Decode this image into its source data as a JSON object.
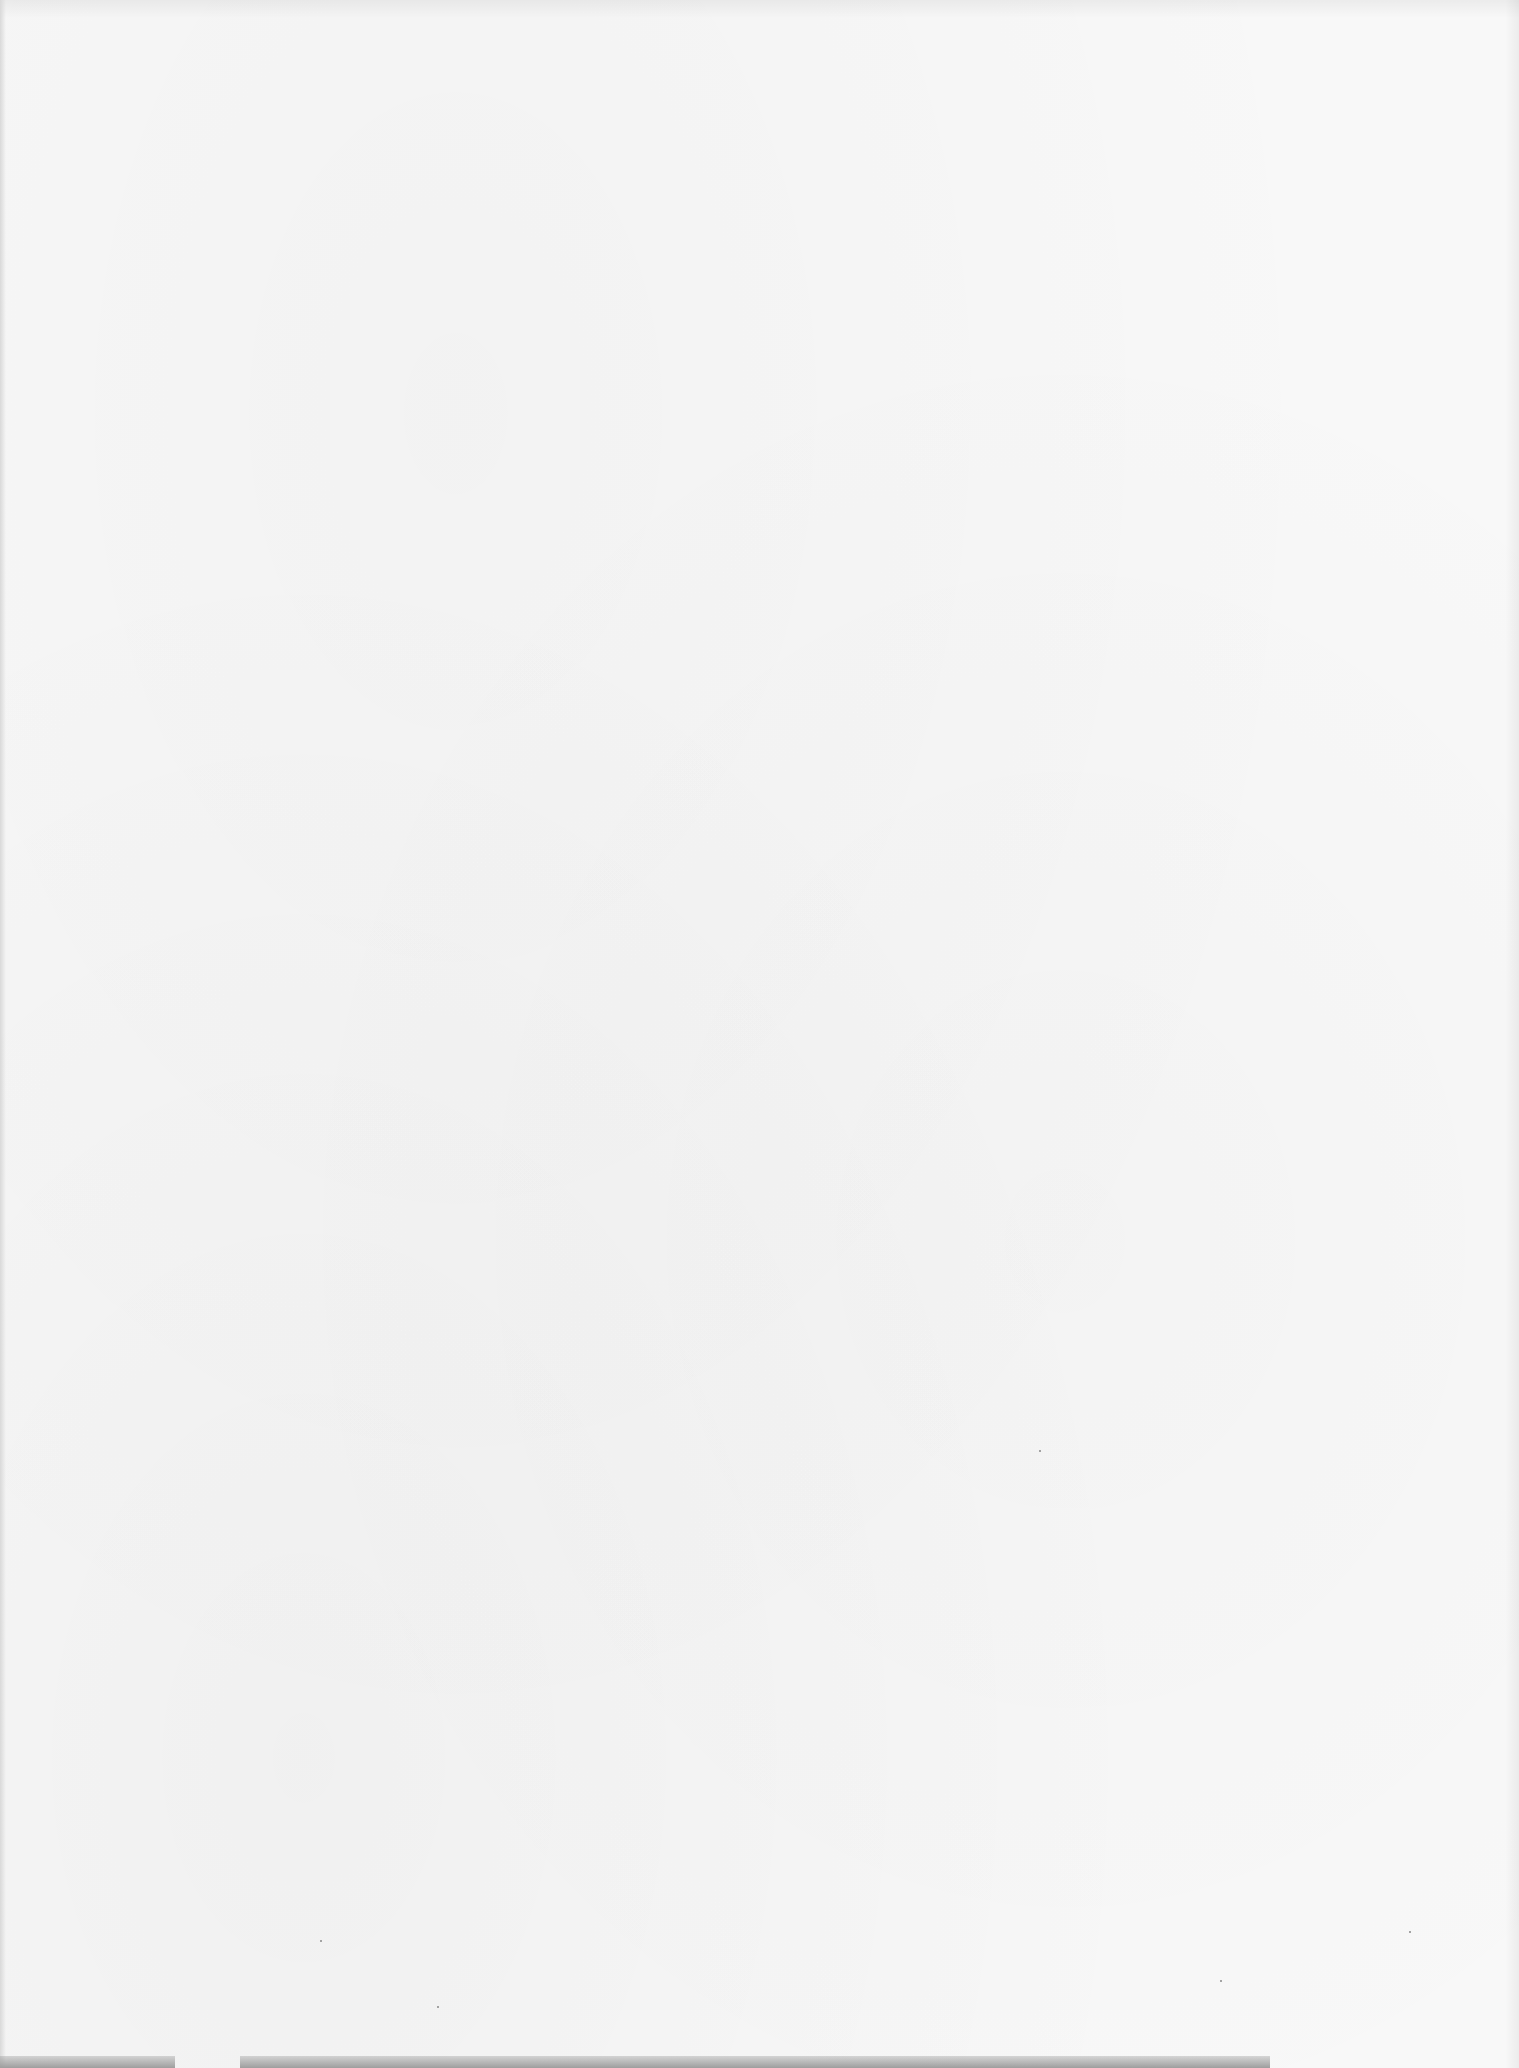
{
  "page": {
    "type": "blank-scanned-page",
    "background_color": "#f8f8f8",
    "text_content": []
  },
  "scan_artifacts": {
    "edge_color": "#9e9e9e",
    "bottom_strips": [
      {
        "left": 0,
        "width": 175
      },
      {
        "left": 240,
        "width": 1030
      }
    ],
    "specks": [
      {
        "x": 320,
        "y": 1940
      },
      {
        "x": 437,
        "y": 2006
      },
      {
        "x": 1409,
        "y": 1931
      },
      {
        "x": 1039,
        "y": 1450
      },
      {
        "x": 1220,
        "y": 1980
      }
    ]
  }
}
